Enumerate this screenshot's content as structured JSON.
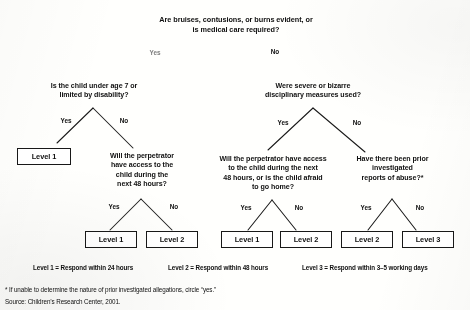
{
  "diagram": {
    "root_question": "Are bruises, contusions, or burns evident, or\nis medical care required?",
    "root_yes": "Yes",
    "root_no": "No",
    "nodes": {
      "left_q": "Is the child under age 7 or\nlimited by disability?",
      "left_yes": "Yes",
      "left_no": "No",
      "left_sub_q": "Will the perpetrator\nhave access to the\nchild during the\nnext 48 hours?",
      "left_sub_yes": "Yes",
      "left_sub_no": "No",
      "right_q": "Were severe or bizarre\ndisciplinary measures used?",
      "right_yes": "Yes",
      "right_no": "No",
      "right_sub_left_q": "Will the perpetrator have access\nto the child during the next\n48 hours, or is the child afraid\nto go home?",
      "right_sub_left_yes": "Yes",
      "right_sub_left_no": "No",
      "right_sub_right_q": "Have there been prior\ninvestigated\nreports of abuse?*",
      "right_sub_right_yes": "Yes",
      "right_sub_right_no": "No"
    },
    "leaves": [
      {
        "label": "Level 1"
      },
      {
        "label": "Level 1"
      },
      {
        "label": "Level 2"
      },
      {
        "label": "Level 1"
      },
      {
        "label": "Level 2"
      },
      {
        "label": "Level 2"
      },
      {
        "label": "Level 3"
      }
    ],
    "legend": [
      "Level 1 = Respond within 24 hours",
      "Level 2 = Respond within 48 hours",
      "Level 3 = Respond within 3–5 working days"
    ],
    "footnotes": [
      "* If unable to determine the nature of prior investigated allegations, circle “yes.”",
      "Source: Children’s Research Center, 2001."
    ]
  }
}
